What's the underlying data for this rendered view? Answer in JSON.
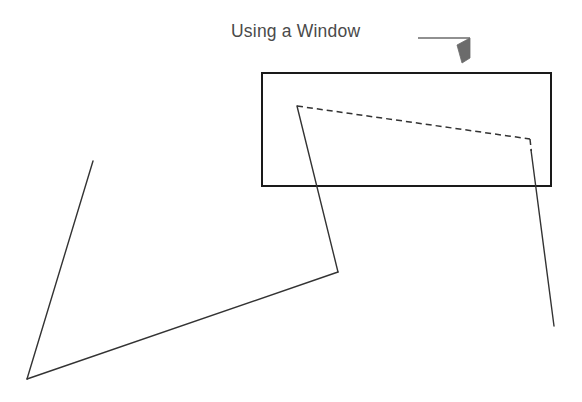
{
  "figure": {
    "title": "Using a Window",
    "background_color": "#ffffff",
    "annotation": {
      "label": "Using a Window",
      "label_color": "#4a4a4a",
      "label_x": 231,
      "label_y": 20,
      "font_size_px": 17.5,
      "leader_line": {
        "name": "leader-line",
        "color": "#6b6b6b",
        "stroke_width": 1.4,
        "points": "418,38 470,38"
      },
      "arrow_head": {
        "name": "arrow-head",
        "color": "#6b6b6b",
        "fill": "#6b6b6b",
        "points": "470,38 470,58 462,63 457,45",
        "tip_x": 462,
        "tip_y": 63
      }
    },
    "selection_window": {
      "name": "selection-window-rectangle",
      "x": 262,
      "y": 73,
      "width": 289,
      "height": 113,
      "stroke": "#1a1a1a",
      "stroke_width": 1.5,
      "fill": "none"
    },
    "geometry": {
      "stroke": "#333333",
      "stroke_width": 1.4,
      "dash_pattern": "6,4",
      "vertices": {
        "top_left_corner": [
          297,
          106
        ],
        "right_corner": [
          530,
          139
        ],
        "lower_right_corner": [
          338,
          272
        ],
        "bottom_left_corner": [
          27,
          379
        ],
        "left_open_end": [
          93,
          161
        ],
        "right_open_end": [
          554,
          326
        ]
      },
      "edges": [
        {
          "name": "highlighted-top-edge",
          "style": "dashed",
          "from": [
            297,
            106
          ],
          "to": [
            530,
            139
          ],
          "note": "edge inside window - selected"
        },
        {
          "name": "highlighted-right-stub",
          "style": "dashed",
          "from": [
            530,
            139
          ],
          "to": [
            531,
            150
          ],
          "note": "short selected stub"
        },
        {
          "name": "left-slanted-edge",
          "style": "solid",
          "from": [
            297,
            106
          ],
          "to": [
            338,
            272
          ]
        },
        {
          "name": "bottom-long-edge",
          "style": "solid",
          "from": [
            338,
            272
          ],
          "to": [
            27,
            379
          ]
        },
        {
          "name": "left-upward-edge",
          "style": "solid",
          "from": [
            27,
            379
          ],
          "to": [
            93,
            161
          ]
        },
        {
          "name": "right-descending-edge",
          "style": "solid",
          "from": [
            531,
            150
          ],
          "to": [
            554,
            326
          ]
        }
      ]
    }
  }
}
